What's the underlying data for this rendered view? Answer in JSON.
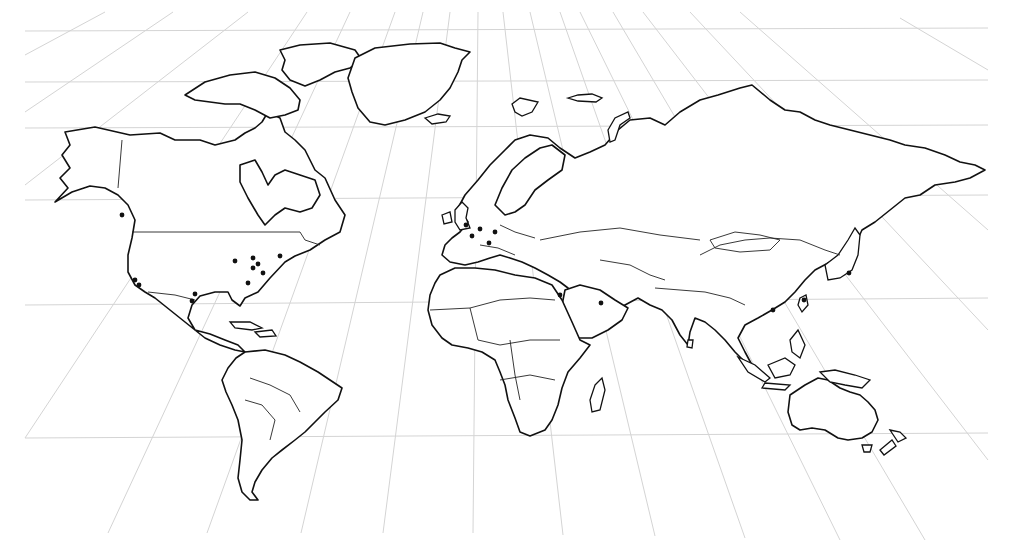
{
  "map": {
    "title": "World map with perspective grid and marked locations",
    "style": {
      "background": "#ffffff",
      "grid_color": "#d4d4d4",
      "outline_color": "#111111",
      "dot_color": "#111111"
    },
    "grid": {
      "horizontal": [
        {
          "x1": 25,
          "y1": 31,
          "x2": 988,
          "y2": 28
        },
        {
          "x1": 25,
          "y1": 82,
          "x2": 988,
          "y2": 80
        },
        {
          "x1": 25,
          "y1": 128,
          "x2": 988,
          "y2": 125
        },
        {
          "x1": 25,
          "y1": 200,
          "x2": 988,
          "y2": 195
        },
        {
          "x1": 25,
          "y1": 305,
          "x2": 988,
          "y2": 298
        },
        {
          "x1": 25,
          "y1": 438,
          "x2": 988,
          "y2": 433
        }
      ],
      "vertical": [
        {
          "x1": 105,
          "y1": 12,
          "x2": 25,
          "y2": 55
        },
        {
          "x1": 173,
          "y1": 12,
          "x2": 25,
          "y2": 112
        },
        {
          "x1": 248,
          "y1": 12,
          "x2": 25,
          "y2": 185
        },
        {
          "x1": 307,
          "y1": 12,
          "x2": 25,
          "y2": 438
        },
        {
          "x1": 350,
          "y1": 12,
          "x2": 108,
          "y2": 533
        },
        {
          "x1": 395,
          "y1": 12,
          "x2": 207,
          "y2": 533
        },
        {
          "x1": 423,
          "y1": 12,
          "x2": 301,
          "y2": 533
        },
        {
          "x1": 450,
          "y1": 12,
          "x2": 383,
          "y2": 533
        },
        {
          "x1": 478,
          "y1": 12,
          "x2": 473,
          "y2": 533
        },
        {
          "x1": 503,
          "y1": 12,
          "x2": 563,
          "y2": 535
        },
        {
          "x1": 530,
          "y1": 12,
          "x2": 655,
          "y2": 536
        },
        {
          "x1": 560,
          "y1": 12,
          "x2": 745,
          "y2": 538
        },
        {
          "x1": 580,
          "y1": 12,
          "x2": 840,
          "y2": 540
        },
        {
          "x1": 613,
          "y1": 12,
          "x2": 925,
          "y2": 540
        },
        {
          "x1": 643,
          "y1": 12,
          "x2": 988,
          "y2": 460
        },
        {
          "x1": 690,
          "y1": 12,
          "x2": 988,
          "y2": 330
        },
        {
          "x1": 740,
          "y1": 12,
          "x2": 988,
          "y2": 230
        },
        {
          "x1": 900,
          "y1": 18,
          "x2": 988,
          "y2": 70
        }
      ]
    },
    "continents": [
      {
        "name": "north-america",
        "d": "M65,132 L95,127 L130,135 L160,133 L175,140 L200,140 L215,145 L235,140 L245,133 L255,128 L262,122 L268,112 L280,118 L285,132 L295,140 L305,150 L315,170 L325,178 L335,200 L345,215 L340,232 L325,240 L310,250 L295,256 L285,262 L270,278 L258,292 L245,298 L240,306 L232,300 L228,292 L215,292 L200,296 L192,305 L188,318 L195,330 L210,334 L225,340 L238,345 L245,352 L235,350 L220,345 L205,338 L185,322 L170,310 L155,298 L145,292 L135,285 L128,272 L128,255 L132,238 L135,220 L128,205 L118,195 L105,188 L90,186 L72,192 L55,202 L68,188 L60,178 L70,168 L62,155 L70,145 Z"
      },
      {
        "name": "canadian-arctic",
        "d": "M185,95 L205,82 L230,75 L255,72 L275,78 L290,88 L300,100 L298,110 L285,115 L270,118 L255,110 L240,104 L225,104 L210,102 L195,100 Z"
      },
      {
        "name": "baffin",
        "d": "M280,50 L300,45 L330,43 L355,50 L362,60 L350,68 L335,72 L320,80 L305,86 L290,80 L282,70 L285,60 Z"
      },
      {
        "name": "greenland",
        "d": "M355,58 L375,48 L410,44 L440,43 L455,48 L470,52 L462,60 L458,72 L450,88 L440,100 L425,112 L405,120 L385,125 L370,122 L358,108 L352,92 L348,78 Z"
      },
      {
        "name": "hudson-peninsula",
        "d": "M240,165 L255,160 L262,172 L268,185 L275,175 L285,170 L300,175 L315,180 L320,195 L312,208 L300,212 L285,208 L275,215 L265,225 L258,215 L248,198 L240,182 Z"
      },
      {
        "name": "south-america",
        "d": "M245,352 L265,350 L285,355 L300,362 L318,372 L330,380 L342,388 L338,400 L325,412 L315,422 L305,432 L295,440 L282,450 L272,458 L262,470 L255,482 L252,492 L258,500 L250,500 L242,492 L238,478 L240,460 L242,440 L238,420 L232,405 L226,392 L222,380 L228,368 L236,358 Z"
      },
      {
        "name": "eurasia",
        "d": "M458,208 L465,195 L478,180 L490,165 L505,150 L515,140 L530,135 L548,138 L560,148 L575,158 L590,152 L605,145 L618,130 L630,120 L650,118 L665,125 L680,112 L700,100 L718,95 L740,88 L752,85 L770,100 L785,110 L800,112 L815,120 L830,125 L850,130 L870,135 L890,140 L905,145 L925,148 L945,155 L960,162 L975,165 L985,170 L970,178 L955,182 L935,185 L920,195 L905,198 L890,210 L875,222 L862,230 L855,245 L842,255 L830,262 L815,270 L805,280 L795,292 L785,302 L772,310 L758,318 L745,325 L738,338 L745,352 L752,365 L745,362 L735,352 L725,340 L715,330 L705,322 L695,318 L690,332 L688,345 L680,335 L672,320 L662,310 L650,305 L638,298 L625,305 L612,315 L598,322 L585,318 L575,300 L568,288 L560,282 L548,275 L535,268 L522,262 L510,258 L500,255 L490,258 L478,262 L465,265 L450,262 L442,255 L445,245 L452,238 L460,232 L468,222 Z"
      },
      {
        "name": "scandinavia",
        "d": "M495,205 L502,188 L512,170 L525,158 L540,148 L552,145 L565,155 L562,170 L548,180 L535,190 L525,205 L515,212 L505,215 Z"
      },
      {
        "name": "arabia",
        "d": "M565,290 L580,285 L600,290 L615,300 L628,308 L622,320 L608,330 L592,338 L578,338 L570,322 L562,305 Z"
      },
      {
        "name": "africa",
        "d": "M440,275 L455,268 L475,268 L495,270 L515,275 L535,278 L552,285 L562,300 L572,322 L580,340 L590,345 L580,358 L568,372 L562,388 L558,405 L552,420 L545,430 L530,436 L520,432 L515,418 L508,400 L505,385 L500,372 L495,360 L482,352 L468,348 L452,345 L442,338 L432,325 L428,310 L430,295 L435,283 Z"
      },
      {
        "name": "australia",
        "d": "M790,395 L805,385 L818,378 L828,380 L840,388 L850,392 L860,395 L868,402 L875,410 L878,420 L872,432 L862,438 L848,440 L838,438 L825,430 L812,428 L800,430 L792,425 L788,412 Z"
      }
    ],
    "islands": [
      {
        "name": "iceland",
        "d": "M425,118 L438,114 L450,116 L446,122 L432,124 Z"
      },
      {
        "name": "britain",
        "d": "M455,210 L462,202 L468,208 L466,218 L470,228 L460,230 L455,222 Z"
      },
      {
        "name": "ireland",
        "d": "M442,215 L450,212 L452,222 L444,224 Z"
      },
      {
        "name": "svalbard",
        "d": "M512,104 L520,98 L538,102 L532,112 L522,116 L515,112 Z"
      },
      {
        "name": "franz-josef",
        "d": "M568,98 L578,95 L592,94 L602,98 L596,102 L578,101 Z"
      },
      {
        "name": "novaya-zemlya",
        "d": "M608,130 L615,118 L628,112 L630,118 L620,125 L615,140 L610,142 Z"
      },
      {
        "name": "madagascar",
        "d": "M595,385 L602,378 L605,390 L600,410 L592,412 L590,400 Z"
      },
      {
        "name": "japan",
        "d": "M825,265 L838,255 L848,240 L855,228 L860,235 L858,255 L852,270 L840,278 L828,280 Z"
      },
      {
        "name": "taiwan",
        "d": "M800,298 L806,295 L808,305 L802,312 L798,305 Z"
      },
      {
        "name": "philippines",
        "d": "M790,340 L798,330 L805,345 L800,358 L792,352 Z"
      },
      {
        "name": "sumatra",
        "d": "M738,357 L755,365 L770,378 L765,382 L748,372 Z"
      },
      {
        "name": "borneo",
        "d": "M768,365 L785,358 L795,365 L790,375 L775,378 Z"
      },
      {
        "name": "java",
        "d": "M765,383 L790,385 L785,390 L762,388 Z"
      },
      {
        "name": "new-guinea",
        "d": "M820,372 L835,370 L855,375 L870,380 L862,388 L845,385 L830,382 Z"
      },
      {
        "name": "tasmania",
        "d": "M862,445 L872,445 L870,452 L864,452 Z"
      },
      {
        "name": "new-zealand-north",
        "d": "M890,430 L900,432 L906,438 L898,442 Z"
      },
      {
        "name": "new-zealand-south",
        "d": "M880,450 L892,440 L896,446 L884,455 Z"
      },
      {
        "name": "cuba",
        "d": "M230,322 L250,322 L262,328 L252,330 L235,328 Z"
      },
      {
        "name": "hispaniola",
        "d": "M255,332 L272,330 L276,336 L260,337 Z"
      },
      {
        "name": "sri-lanka",
        "d": "M688,340 L693,340 L692,348 L687,347 Z"
      }
    ],
    "borders": [
      {
        "name": "us-canada",
        "d": "M132,232 L300,232 L305,240 L320,245"
      },
      {
        "name": "alaska-canada",
        "d": "M122,140 L118,188"
      },
      {
        "name": "us-mexico",
        "d": "M148,292 L175,295 L195,300"
      },
      {
        "name": "sahara-line-1",
        "d": "M430,310 L470,308 L500,300 L530,298 L555,300"
      },
      {
        "name": "sahara-line-2",
        "d": "M470,308 L478,340 L500,345 L530,340 L560,340"
      },
      {
        "name": "africa-south",
        "d": "M500,380 L530,375 L555,380"
      },
      {
        "name": "africa-central",
        "d": "M510,340 L515,375 L520,400"
      },
      {
        "name": "china-border",
        "d": "M700,255 L720,245 L745,240 L770,238 L800,240 L825,250 L840,255"
      },
      {
        "name": "mongolia",
        "d": "M710,240 L735,232 L760,235 L780,240 L770,250 L740,252 L715,248 Z"
      },
      {
        "name": "india-north",
        "d": "M655,288 L680,290 L705,292 L730,298 L745,305"
      },
      {
        "name": "russia-south",
        "d": "M540,240 L580,232 L620,228 L660,235 L700,240"
      },
      {
        "name": "europe-east",
        "d": "M500,225 L515,232 L535,238"
      },
      {
        "name": "europe-mid",
        "d": "M480,245 L498,248 L515,255"
      },
      {
        "name": "south-america-1",
        "d": "M250,378 L270,385 L290,395 L300,412"
      },
      {
        "name": "south-america-2",
        "d": "M245,400 L262,405 L275,420 L270,440"
      },
      {
        "name": "central-asia",
        "d": "M600,260 L630,265 L650,275 L665,280"
      }
    ],
    "dots": [
      {
        "name": "dot-seattle",
        "x": 122,
        "y": 215
      },
      {
        "name": "dot-sf",
        "x": 135,
        "y": 280
      },
      {
        "name": "dot-la",
        "x": 139,
        "y": 285
      },
      {
        "name": "dot-dallas",
        "x": 195,
        "y": 294
      },
      {
        "name": "dot-houston",
        "x": 192,
        "y": 301
      },
      {
        "name": "dot-chicago",
        "x": 235,
        "y": 261
      },
      {
        "name": "dot-detroit",
        "x": 253,
        "y": 258
      },
      {
        "name": "dot-cleveland",
        "x": 258,
        "y": 264
      },
      {
        "name": "dot-pittsburgh",
        "x": 253,
        "y": 268
      },
      {
        "name": "dot-nyc",
        "x": 263,
        "y": 273
      },
      {
        "name": "dot-boston",
        "x": 280,
        "y": 256
      },
      {
        "name": "dot-atlanta",
        "x": 248,
        "y": 283
      },
      {
        "name": "dot-london",
        "x": 466,
        "y": 225
      },
      {
        "name": "dot-amsterdam",
        "x": 480,
        "y": 229
      },
      {
        "name": "dot-paris",
        "x": 472,
        "y": 236
      },
      {
        "name": "dot-frankfurt",
        "x": 495,
        "y": 232
      },
      {
        "name": "dot-zurich",
        "x": 489,
        "y": 243
      },
      {
        "name": "dot-cairo",
        "x": 560,
        "y": 295
      },
      {
        "name": "dot-riyadh",
        "x": 601,
        "y": 303
      },
      {
        "name": "dot-hongkong",
        "x": 773,
        "y": 310
      },
      {
        "name": "dot-taipei",
        "x": 804,
        "y": 300
      },
      {
        "name": "dot-tokyo",
        "x": 849,
        "y": 273
      }
    ]
  }
}
